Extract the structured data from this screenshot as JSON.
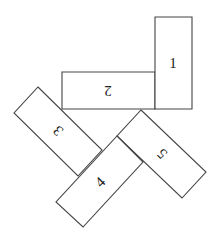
{
  "diagram": {
    "stroke_color": "#444444",
    "fill_color": "#ffffff",
    "blocks": [
      {
        "label": "1",
        "points": "155,17 192,17 192,109 155,109",
        "center": [
          173,
          63
        ],
        "rotation": 0
      },
      {
        "label": "2",
        "points": "62,72 155,72 155,109 62,109",
        "center": [
          108,
          91
        ],
        "rotation": 180
      },
      {
        "label": "3",
        "points": "38,87 102,150 78,176 14,113",
        "center": [
          58,
          131
        ],
        "rotation": -135
      },
      {
        "label": "4",
        "points": "117,136 143,162 83,227 56,202",
        "center": [
          100,
          182
        ],
        "rotation": -45
      },
      {
        "label": "5",
        "points": "141,110 206,172 182,198 117,136",
        "center": [
          162,
          154
        ],
        "rotation": -135
      }
    ]
  }
}
